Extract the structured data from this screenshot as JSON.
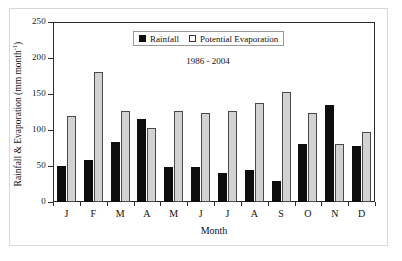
{
  "chart_data": {
    "type": "bar",
    "title": "",
    "subtitle": "1986 - 2004",
    "xlabel": "Month",
    "ylabel": "Rainfall & Evaporation (mm month",
    "ylabel_superscript": "-1",
    "ylabel_suffix": ")",
    "categories": [
      "J",
      "F",
      "M",
      "A",
      "M",
      "J",
      "J",
      "A",
      "S",
      "O",
      "N",
      "D"
    ],
    "ylim": [
      0,
      250
    ],
    "yticks": [
      0,
      50,
      100,
      150,
      200,
      250
    ],
    "grid": false,
    "legend_position": "top-center",
    "series": [
      {
        "name": "Rainfall",
        "color": "#0d0d0d",
        "values": [
          50,
          58,
          84,
          115,
          49,
          48,
          40,
          44,
          29,
          81,
          135,
          78
        ]
      },
      {
        "name": "Potential Evaporation",
        "color": "#d2d2d2",
        "values": [
          120,
          180,
          126,
          103,
          126,
          123,
          127,
          138,
          153,
          123,
          81,
          97
        ]
      }
    ]
  }
}
